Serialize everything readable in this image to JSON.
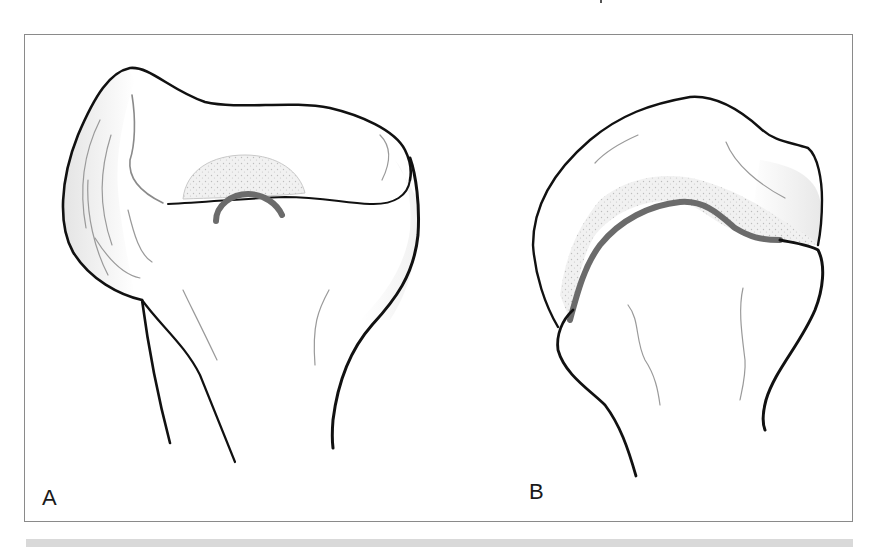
{
  "figure": {
    "panels": [
      {
        "id": "A",
        "label": "A"
      },
      {
        "id": "B",
        "label": "B"
      }
    ],
    "colors": {
      "outline": "#111111",
      "detail_lines": "#9a9a9a",
      "growth_plate": "#6b6b6b",
      "stipple_region": "#e6e6e6",
      "shading": "#efefef",
      "frame_border": "#8a8a8a",
      "bottom_bar": "#d9d9d9"
    }
  }
}
